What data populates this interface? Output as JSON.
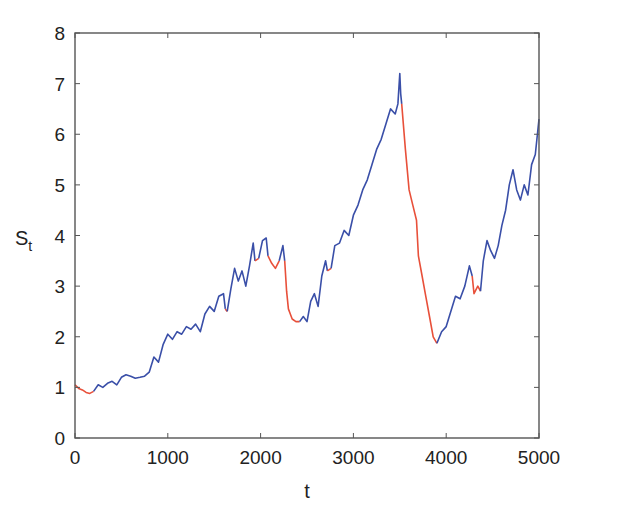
{
  "chart_data": {
    "type": "line",
    "title": "",
    "xlabel": "t",
    "ylabel": "S",
    "ylabel_subscript": "t",
    "xlim": [
      0,
      5000
    ],
    "ylim": [
      0,
      8
    ],
    "xticks": [
      0,
      1000,
      2000,
      3000,
      4000,
      5000
    ],
    "yticks": [
      0,
      1,
      2,
      3,
      4,
      5,
      6,
      7,
      8
    ],
    "grid": false,
    "legend": null,
    "colors": {
      "regime_a": "#3a4fa8",
      "regime_b": "#e8503a",
      "axis": "#555555"
    },
    "series": [
      {
        "name": "S_t",
        "note": "price path colored by regime; segments listed in order",
        "segments": [
          {
            "color": "regime_b",
            "x": [
              0,
              40,
              80,
              120,
              160,
              200
            ],
            "y": [
              1.05,
              0.98,
              0.95,
              0.9,
              0.88,
              0.92
            ]
          },
          {
            "color": "regime_a",
            "x": [
              200,
              250,
              300,
              350,
              400,
              450,
              500,
              550,
              600,
              650,
              700,
              750,
              800,
              850,
              900,
              950,
              1000,
              1050,
              1100,
              1150,
              1200,
              1250,
              1300,
              1350,
              1400,
              1450,
              1500,
              1550,
              1600,
              1620
            ],
            "y": [
              0.92,
              1.05,
              1.0,
              1.08,
              1.12,
              1.05,
              1.2,
              1.25,
              1.22,
              1.18,
              1.2,
              1.22,
              1.3,
              1.6,
              1.5,
              1.85,
              2.05,
              1.95,
              2.1,
              2.05,
              2.2,
              2.15,
              2.25,
              2.1,
              2.45,
              2.6,
              2.5,
              2.8,
              2.85,
              2.55
            ]
          },
          {
            "color": "regime_b",
            "x": [
              1620,
              1640
            ],
            "y": [
              2.55,
              2.5
            ]
          },
          {
            "color": "regime_a",
            "x": [
              1640,
              1680,
              1720,
              1760,
              1800,
              1840,
              1880,
              1920,
              1940
            ],
            "y": [
              2.5,
              2.95,
              3.35,
              3.1,
              3.3,
              3.0,
              3.4,
              3.85,
              3.5
            ]
          },
          {
            "color": "regime_b",
            "x": [
              1940,
              1980
            ],
            "y": [
              3.5,
              3.55
            ]
          },
          {
            "color": "regime_a",
            "x": [
              1980,
              2020,
              2060,
              2080
            ],
            "y": [
              3.55,
              3.9,
              3.95,
              3.6
            ]
          },
          {
            "color": "regime_b",
            "x": [
              2080,
              2120,
              2160,
              2200
            ],
            "y": [
              3.6,
              3.45,
              3.35,
              3.5
            ]
          },
          {
            "color": "regime_a",
            "x": [
              2200,
              2240,
              2260
            ],
            "y": [
              3.5,
              3.8,
              3.5
            ]
          },
          {
            "color": "regime_b",
            "x": [
              2260,
              2280,
              2300,
              2320,
              2340,
              2380,
              2420
            ],
            "y": [
              3.5,
              2.9,
              2.55,
              2.45,
              2.35,
              2.3,
              2.3
            ]
          },
          {
            "color": "regime_a",
            "x": [
              2420,
              2460,
              2500,
              2540,
              2580,
              2620,
              2660,
              2700,
              2720
            ],
            "y": [
              2.3,
              2.4,
              2.3,
              2.7,
              2.85,
              2.6,
              3.2,
              3.5,
              3.3
            ]
          },
          {
            "color": "regime_b",
            "x": [
              2720,
              2760
            ],
            "y": [
              3.3,
              3.35
            ]
          },
          {
            "color": "regime_a",
            "x": [
              2760,
              2800,
              2850,
              2900,
              2950,
              3000,
              3050,
              3100,
              3150,
              3200,
              3250,
              3300,
              3350,
              3400,
              3450,
              3480,
              3500,
              3510,
              3520
            ],
            "y": [
              3.35,
              3.8,
              3.85,
              4.1,
              4.0,
              4.4,
              4.6,
              4.9,
              5.1,
              5.4,
              5.7,
              5.9,
              6.2,
              6.5,
              6.4,
              6.6,
              7.2,
              6.8,
              6.6
            ]
          },
          {
            "color": "regime_b",
            "x": [
              3520,
              3560,
              3600,
              3640,
              3680,
              3700,
              3740,
              3780,
              3820,
              3860,
              3900
            ],
            "y": [
              6.6,
              5.7,
              4.9,
              4.6,
              4.3,
              3.6,
              3.2,
              2.8,
              2.4,
              2.0,
              1.87
            ]
          },
          {
            "color": "regime_a",
            "x": [
              3900,
              3950,
              4000,
              4050,
              4100,
              4150,
              4200,
              4250,
              4280
            ],
            "y": [
              1.87,
              2.1,
              2.2,
              2.5,
              2.8,
              2.75,
              3.0,
              3.4,
              3.2
            ]
          },
          {
            "color": "regime_b",
            "x": [
              4280,
              4300,
              4340,
              4370
            ],
            "y": [
              3.2,
              2.85,
              3.0,
              2.9
            ]
          },
          {
            "color": "regime_a",
            "x": [
              4370,
              4400,
              4440,
              4480,
              4520,
              4560,
              4600,
              4640,
              4680,
              4720,
              4760,
              4800,
              4840,
              4880,
              4920,
              4960,
              5000
            ],
            "y": [
              2.9,
              3.5,
              3.9,
              3.7,
              3.55,
              3.8,
              4.2,
              4.5,
              5.0,
              5.3,
              4.9,
              4.7,
              5.0,
              4.8,
              5.4,
              5.6,
              6.3
            ]
          }
        ]
      }
    ]
  }
}
